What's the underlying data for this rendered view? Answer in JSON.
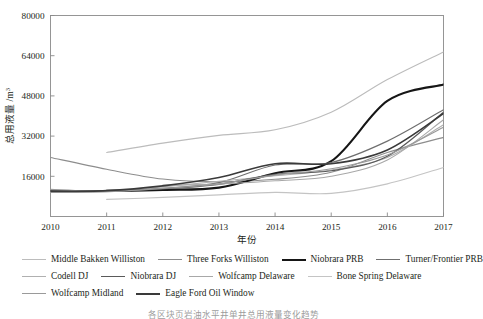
{
  "chart_data": {
    "type": "line",
    "title": "",
    "xlabel": "年份",
    "ylabel": "总用液量 /m",
    "ylabel_sup": "3",
    "x": [
      2010,
      2011,
      2012,
      2013,
      2014,
      2015,
      2016,
      2017
    ],
    "xlim": [
      2010,
      2017
    ],
    "ylim": [
      0,
      80000
    ],
    "xticks": [
      "2010",
      "2011",
      "2012",
      "2013",
      "2014",
      "2015",
      "2016",
      "2017"
    ],
    "yticks": [
      "16000",
      "32000",
      "48000",
      "64000",
      "80000"
    ],
    "ytick_values": [
      16000,
      32000,
      48000,
      64000,
      80000
    ],
    "grid": false,
    "legend_position": "below",
    "series": [
      {
        "name": "Middle Bakken Williston",
        "color": "#bcbcbc",
        "width": 1.1,
        "x": [
          2011,
          2012,
          2013,
          2014,
          2015,
          2016,
          2017
        ],
        "values": [
          25500,
          29200,
          32300,
          34500,
          41500,
          54500,
          65500
        ]
      },
      {
        "name": "Three Forks Williston",
        "color": "#8d8d8d",
        "width": 1.1,
        "x": [
          2010,
          2011,
          2012,
          2013,
          2014,
          2015,
          2016,
          2017
        ],
        "values": [
          23500,
          18800,
          14900,
          13800,
          14800,
          17600,
          25500,
          31500
        ]
      },
      {
        "name": "Niobrara PRB",
        "color": "#161616",
        "width": 2.1,
        "x": [
          2011,
          2012,
          2013,
          2014,
          2015,
          2016,
          2017
        ],
        "values": [
          10200,
          10600,
          11500,
          17200,
          22000,
          46000,
          52500
        ]
      },
      {
        "name": "Turner/Frontier PRB",
        "color": "#6f6f6f",
        "width": 1.2,
        "x": [
          2010,
          2011,
          2012,
          2013,
          2014,
          2015,
          2016,
          2017
        ],
        "values": [
          10200,
          10300,
          11200,
          13500,
          20500,
          21500,
          30000,
          42500
        ]
      },
      {
        "name": "Codell DJ",
        "color": "#b0b0b0",
        "width": 1.1,
        "x": [
          2010,
          2011,
          2012,
          2013,
          2014,
          2015,
          2016,
          2017
        ],
        "values": [
          9600,
          9800,
          11800,
          14000,
          16200,
          18500,
          23500,
          36500
        ]
      },
      {
        "name": "Niobrara DJ",
        "color": "#5a5a5a",
        "width": 1.2,
        "x": [
          2010,
          2011,
          2012,
          2013,
          2014,
          2015,
          2016,
          2017
        ],
        "values": [
          10400,
          10100,
          11000,
          12800,
          16800,
          18200,
          24000,
          41500
        ]
      },
      {
        "name": "Wolfcamp Delaware",
        "color": "#a8a8a8",
        "width": 1.1,
        "x": [
          2012,
          2013,
          2014,
          2015,
          2016,
          2017
        ],
        "values": [
          12500,
          12900,
          14200,
          16000,
          22500,
          38500
        ]
      },
      {
        "name": "Bone Spring Delaware",
        "color": "#c4c4c4",
        "width": 1.1,
        "x": [
          2011,
          2012,
          2013,
          2014,
          2015,
          2016,
          2017
        ],
        "values": [
          6800,
          7600,
          8600,
          9600,
          9200,
          13000,
          19500
        ]
      },
      {
        "name": "Wolfcamp Midland",
        "color": "#9a9a9a",
        "width": 1.2,
        "x": [
          2010,
          2011,
          2012,
          2013,
          2014,
          2015,
          2016,
          2017
        ],
        "values": [
          10800,
          10000,
          11200,
          13000,
          16500,
          19000,
          24500,
          35500
        ]
      },
      {
        "name": "Eagle Ford Oil Window",
        "color": "#3a3a3a",
        "width": 1.6,
        "x": [
          2010,
          2011,
          2012,
          2013,
          2014,
          2015,
          2016,
          2017
        ],
        "values": [
          10000,
          10300,
          12200,
          15500,
          21000,
          21000,
          26500,
          41000
        ]
      }
    ]
  },
  "axis": {
    "y_title_main": "总用液量 /m",
    "y_title_sup": "3",
    "x_title": "年份"
  },
  "legend": {
    "rows": [
      [
        {
          "label": "Middle Bakken Williston",
          "color": "#bcbcbc",
          "width": 1.3
        },
        {
          "label": "Three Forks Williston",
          "color": "#8d8d8d",
          "width": 1.5
        },
        {
          "label": "Niobrara PRB",
          "color": "#161616",
          "width": 2.4
        },
        {
          "label": "Turner/Frontier PRB",
          "color": "#6f6f6f",
          "width": 1.6
        }
      ],
      [
        {
          "label": "Codell DJ",
          "color": "#b0b0b0",
          "width": 1.3
        },
        {
          "label": "Niobrara DJ",
          "color": "#5a5a5a",
          "width": 1.6
        },
        {
          "label": "Wolfcamp Delaware",
          "color": "#a8a8a8",
          "width": 1.3
        },
        {
          "label": "Bone Spring Delaware",
          "color": "#c4c4c4",
          "width": 1.3
        }
      ],
      [
        {
          "label": "Wolfcamp Midland",
          "color": "#9a9a9a",
          "width": 1.5
        },
        {
          "label": "Eagle Ford Oil Window",
          "color": "#3a3a3a",
          "width": 2.0
        }
      ]
    ]
  },
  "caption": {
    "text": "各区块页岩油水平井单井总用液量变化趋势"
  },
  "style": {
    "axis_color": "#8a8a8a",
    "text_color": "#231f20",
    "background": "#ffffff"
  }
}
